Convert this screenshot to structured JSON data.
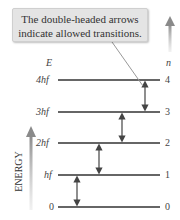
{
  "callout": {
    "line1": "The double-headed arrows",
    "line2": "indicate allowed transitions."
  },
  "axis": {
    "left_header": "E",
    "right_header": "n",
    "side_label": "ENERGY"
  },
  "levels": [
    {
      "n": "4",
      "energy": "4hf",
      "y": 80
    },
    {
      "n": "3",
      "energy": "3hf",
      "y": 112
    },
    {
      "n": "2",
      "energy": "2hf",
      "y": 143
    },
    {
      "n": "1",
      "energy": "hf",
      "y": 175
    },
    {
      "n": "0",
      "energy": "0",
      "y": 207
    }
  ],
  "transitions": [
    {
      "from": "0",
      "to": "1"
    },
    {
      "from": "1",
      "to": "2"
    },
    {
      "from": "2",
      "to": "3"
    },
    {
      "from": "3",
      "to": "4"
    }
  ],
  "colors": {
    "line": "#333333",
    "arrow_gray": "#8a8a8a",
    "callout_bg": "#e4e4e4"
  }
}
